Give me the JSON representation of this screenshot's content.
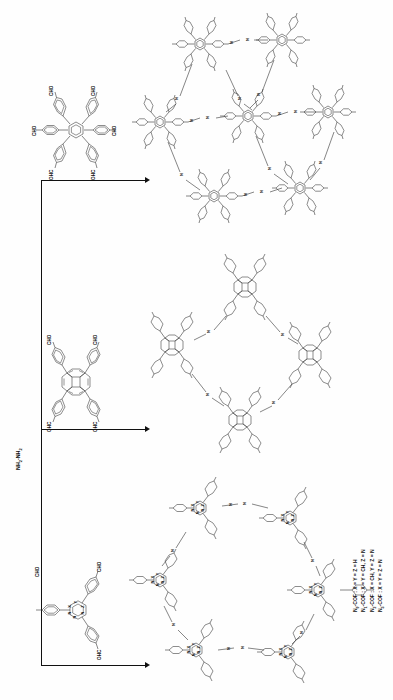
{
  "figure": {
    "domain": "chemical-reaction-scheme",
    "orientation": "rotated-90-ccw",
    "background_color": "#fefefe",
    "line_color": "#111111",
    "ring_color": "#3f3f3f"
  },
  "reagent": {
    "label_html": "NH<sub>2</sub>-NH<sub>2</sub>",
    "label_plain": "NH2-NH2"
  },
  "monomers": [
    {
      "id": "hexakis-formylphenyl-benzene",
      "name": "hexakis(4-formylphenyl)benzene",
      "core": "benzene",
      "arms": 6,
      "arm_label": "CHO",
      "cho_labels": [
        "CHO",
        "CHO",
        "CHO",
        "CHO",
        "OHC",
        "OHC"
      ]
    },
    {
      "id": "tetrakis-formylphenyl-pyrene",
      "name": "1,3,6,8-tetrakis(4-formylphenyl)pyrene",
      "core": "pyrene",
      "arms": 4,
      "arm_label": "CHO",
      "cho_labels": [
        "CHO",
        "CHO",
        "OHC",
        "OHC"
      ]
    },
    {
      "id": "tris-formylphenyl-triazine",
      "name": "2,4,6-tris(4-formylphenyl)-1,3,5-triazine",
      "core": "triazine",
      "arms": 3,
      "arm_label": "CHO",
      "cho_labels": [
        "CHO",
        "CHO",
        "OHC"
      ],
      "core_vertex_labels": [
        "X",
        "Y",
        "Z",
        "N",
        "N",
        "N"
      ]
    }
  ],
  "products": [
    {
      "id": "cof-top",
      "from": "hexakis-formylphenyl-benzene",
      "topology": "kagome / hexagonal network",
      "linkage": "azine (N-N)",
      "node_labels": [
        "N",
        "N"
      ]
    },
    {
      "id": "cof-middle",
      "from": "tetrakis-formylphenyl-pyrene",
      "topology": "rhombic network",
      "linkage": "azine (N-N)",
      "node_labels": [
        "N",
        "N"
      ]
    },
    {
      "id": "cof-bottom",
      "from": "tris-formylphenyl-triazine",
      "topology": "hexagonal network",
      "linkage": "azine (N-N)",
      "node_labels": [
        "X",
        "Y",
        "Z",
        "N",
        "N"
      ]
    }
  ],
  "arrows": [
    {
      "id": "arrow-top",
      "direction": "right"
    },
    {
      "id": "arrow-middle",
      "direction": "right"
    },
    {
      "id": "arrow-bottom",
      "direction": "right"
    }
  ],
  "legend": {
    "lines": [
      {
        "name": "N0-COF",
        "name_html": "N<sub>0</sub>-COF",
        "assignment": "X = Y = Z = H"
      },
      {
        "name": "N1-COF",
        "name_html": "N<sub>1</sub>-COF",
        "assignment": "X = Y = CH, Z = N"
      },
      {
        "name": "N2-COF",
        "name_html": "N<sub>2</sub>-COF",
        "assignment": "X = CH, Y = Z = N"
      },
      {
        "name": "N3-COF",
        "name_html": "N<sub>3</sub>-COF",
        "assignment": "X = Y = Z = N"
      }
    ]
  },
  "atom_labels": {
    "cho": "CHO",
    "ohc": "OHC",
    "nitrogen": "N",
    "x": "X",
    "y": "Y",
    "z": "Z"
  }
}
